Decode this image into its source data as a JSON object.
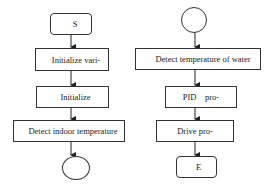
{
  "diagram": {
    "type": "flowchart",
    "left_flow": {
      "nodes": [
        {
          "id": "start",
          "shape": "rounded-rect",
          "label": "S"
        },
        {
          "id": "init-vars",
          "shape": "rect",
          "label": "Initialize vari-"
        },
        {
          "id": "init",
          "shape": "rect",
          "label": "Initialize"
        },
        {
          "id": "detect-indoor",
          "shape": "rect",
          "label": "Detect indoor temperature"
        },
        {
          "id": "connector-out",
          "shape": "circle",
          "label": ""
        }
      ]
    },
    "right_flow": {
      "nodes": [
        {
          "id": "connector-in",
          "shape": "circle",
          "label": ""
        },
        {
          "id": "detect-water",
          "shape": "rect",
          "label": "Detect temperature of water"
        },
        {
          "id": "pid",
          "shape": "rect",
          "label": "PID    pro-"
        },
        {
          "id": "drive",
          "shape": "rect",
          "label": "Drive pro-"
        },
        {
          "id": "end",
          "shape": "rounded-rect",
          "label": "E"
        }
      ]
    },
    "colors": {
      "stroke": "#333333",
      "fill": "#ffffff",
      "text": "#222222"
    }
  }
}
